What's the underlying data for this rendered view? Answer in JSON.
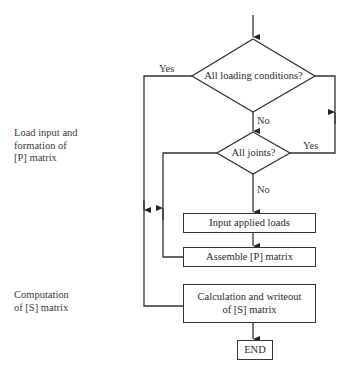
{
  "side_labels": {
    "load_input": [
      "Load input and",
      "formation of",
      "[P] matrix"
    ],
    "computation": [
      "Computation",
      "of [S] matrix"
    ]
  },
  "decisions": [
    {
      "text": "All loading conditions?",
      "yes_label": "Yes",
      "no_label": "No"
    },
    {
      "text": "All joints?",
      "yes_label": "Yes",
      "no_label": "No"
    }
  ],
  "processes": [
    {
      "text": "Input applied loads"
    },
    {
      "text": "Assemble [P] matrix"
    },
    {
      "text": "Calculation and writeout of [S] matrix",
      "lines": [
        "Calculation and writeout",
        "of [S] matrix"
      ]
    }
  ],
  "terminal": {
    "text": "END"
  },
  "colors": {
    "line": "#333333",
    "background": "#ffffff",
    "text": "#2a2a2a"
  }
}
